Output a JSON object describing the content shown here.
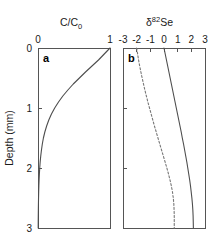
{
  "figure": {
    "background_color": "#ffffff",
    "axis_color": "#555555",
    "solid_curve_color": "#4d4d4d",
    "dashed_curve_color": "#777777",
    "shared_y_axis_title": "Depth (mm)",
    "shared_y_ticks": [
      "0",
      "1",
      "2",
      "3"
    ]
  },
  "panel_a": {
    "tag": "a",
    "x_axis_title_main": "C/C",
    "x_axis_title_sub": "0",
    "x_tick_labels": [
      "0",
      "1"
    ]
  },
  "panel_b": {
    "tag": "b",
    "x_axis_title_delta": "δ",
    "x_axis_title_sup": "82",
    "x_axis_title_element": "Se",
    "x_tick_labels": [
      "-3",
      "-2",
      "-1",
      "0",
      "1",
      "2",
      "3"
    ]
  },
  "chart_data": [
    {
      "type": "line",
      "id": "panel-a",
      "title": "a",
      "xlabel": "C/C0",
      "ylabel": "Depth (mm)",
      "xlim": [
        0,
        1
      ],
      "ylim": [
        0,
        3
      ],
      "y_inverted": true,
      "xticks": [
        0,
        1
      ],
      "yticks": [
        0,
        1,
        2,
        3
      ],
      "grid": false,
      "legend": "none",
      "series": [
        {
          "name": "C/C0 concentration profile",
          "style": "solid",
          "x": [
            1.0,
            0.92,
            0.84,
            0.75,
            0.66,
            0.575,
            0.49,
            0.415,
            0.345,
            0.285,
            0.232,
            0.187,
            0.15,
            0.12,
            0.095,
            0.075,
            0.06,
            0.048,
            0.038,
            0.03,
            0.024,
            0.019,
            0.015,
            0.012,
            0.0095,
            0.0075,
            0.006,
            0.0048,
            0.0038,
            0.003,
            0.0025
          ],
          "y": [
            0.0,
            0.1,
            0.2,
            0.3,
            0.4,
            0.5,
            0.6,
            0.7,
            0.8,
            0.9,
            1.0,
            1.1,
            1.2,
            1.3,
            1.4,
            1.5,
            1.6,
            1.7,
            1.8,
            1.9,
            2.0,
            2.1,
            2.2,
            2.3,
            2.4,
            2.5,
            2.6,
            2.7,
            2.8,
            2.9,
            3.0
          ]
        }
      ]
    },
    {
      "type": "line",
      "id": "panel-b",
      "title": "b",
      "xlabel": "d82Se",
      "ylabel": "Depth (mm)",
      "xlim": [
        -3,
        3
      ],
      "ylim": [
        0,
        3
      ],
      "y_inverted": true,
      "xticks": [
        -3,
        -2,
        -1,
        0,
        1,
        2,
        3
      ],
      "yticks": [
        0,
        1,
        2,
        3
      ],
      "grid": false,
      "legend": "none",
      "series": [
        {
          "name": "dissolved Se isotope profile",
          "style": "dashed",
          "x": [
            -2.0,
            -1.93,
            -1.86,
            -1.78,
            -1.69,
            -1.6,
            -1.5,
            -1.4,
            -1.29,
            -1.18,
            -1.06,
            -0.94,
            -0.82,
            -0.7,
            -0.57,
            -0.44,
            -0.31,
            -0.18,
            -0.05,
            0.08,
            0.21,
            0.33,
            0.44,
            0.54,
            0.62,
            0.68,
            0.72,
            0.74,
            0.75,
            0.75,
            0.75
          ],
          "y": [
            0.0,
            0.1,
            0.2,
            0.3,
            0.4,
            0.5,
            0.6,
            0.7,
            0.8,
            0.9,
            1.0,
            1.1,
            1.2,
            1.3,
            1.4,
            1.5,
            1.6,
            1.7,
            1.8,
            1.9,
            2.0,
            2.1,
            2.2,
            2.3,
            2.4,
            2.5,
            2.6,
            2.7,
            2.8,
            2.9,
            3.0
          ],
          "endpoint_value": 0.75
        },
        {
          "name": "solid-phase Se isotope profile",
          "style": "solid",
          "x": [
            0.0,
            0.09,
            0.18,
            0.27,
            0.36,
            0.45,
            0.54,
            0.63,
            0.72,
            0.81,
            0.9,
            0.99,
            1.08,
            1.17,
            1.26,
            1.34,
            1.43,
            1.51,
            1.59,
            1.67,
            1.74,
            1.81,
            1.88,
            1.94,
            1.99,
            2.04,
            2.08,
            2.11,
            2.13,
            2.14,
            2.15
          ],
          "y": [
            0.0,
            0.1,
            0.2,
            0.3,
            0.4,
            0.5,
            0.6,
            0.7,
            0.8,
            0.9,
            1.0,
            1.1,
            1.2,
            1.3,
            1.4,
            1.5,
            1.6,
            1.7,
            1.8,
            1.9,
            2.0,
            2.1,
            2.2,
            2.3,
            2.4,
            2.5,
            2.6,
            2.7,
            2.8,
            2.9,
            3.0
          ],
          "endpoint_value": 2.15
        }
      ]
    }
  ]
}
